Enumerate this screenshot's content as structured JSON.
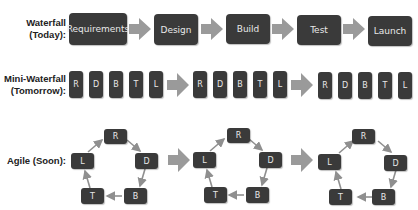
{
  "rows": {
    "waterfall": {
      "label_line1": "Waterfall",
      "label_line2": "(Today):",
      "steps": [
        "Requirements",
        "Design",
        "Build",
        "Test",
        "Launch"
      ]
    },
    "mini_waterfall": {
      "label_line1": "Mini-Waterfall",
      "label_line2": "(Tomorrow):",
      "groups": [
        [
          "R",
          "D",
          "B",
          "T",
          "L"
        ],
        [
          "R",
          "D",
          "B",
          "T",
          "L"
        ],
        [
          "R",
          "D",
          "B",
          "T",
          "L"
        ]
      ]
    },
    "agile": {
      "label": "Agile (Soon):",
      "cycles": [
        {
          "top": "R",
          "right": "D",
          "bottom_right": "B",
          "bottom_left": "T",
          "left": "L"
        },
        {
          "top": "R",
          "right": "D",
          "bottom_right": "B",
          "bottom_left": "T",
          "left": "L"
        },
        {
          "top": "R",
          "right": "D",
          "bottom_right": "B",
          "bottom_left": "T",
          "left": "L"
        }
      ]
    }
  },
  "colors": {
    "box": "#3a3a3a",
    "box_text": "#e8e8e8",
    "arrow": "#9a9a9a"
  }
}
